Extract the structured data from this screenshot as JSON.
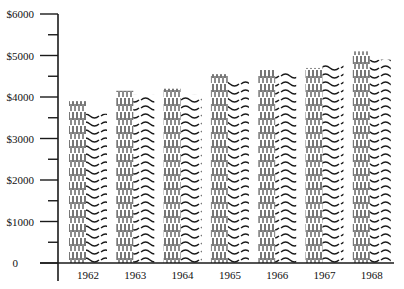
{
  "chart_data": {
    "type": "bar",
    "title": "",
    "xlabel": "",
    "ylabel": "",
    "categories": [
      "1962",
      "1963",
      "1964",
      "1965",
      "1966",
      "1967",
      "1968"
    ],
    "series": [
      {
        "name": "Series A (dashed pattern)",
        "pattern": "dashed-vertical",
        "values": [
          3900,
          4150,
          4200,
          4550,
          4650,
          4700,
          5100
        ]
      },
      {
        "name": "Series B (wavy pattern)",
        "pattern": "wavy-horizontal",
        "values": [
          3600,
          4050,
          4050,
          4400,
          4600,
          4800,
          4900
        ]
      }
    ],
    "ylim": [
      0,
      6000
    ],
    "y_ticks": [
      {
        "value": 0,
        "label": "0"
      },
      {
        "value": 1000,
        "label": "$1000"
      },
      {
        "value": 2000,
        "label": "$2000"
      },
      {
        "value": 3000,
        "label": "$3000"
      },
      {
        "value": 4000,
        "label": "$4000"
      },
      {
        "value": 5000,
        "label": "$5000"
      },
      {
        "value": 6000,
        "label": "$6000"
      }
    ],
    "minor_tick_step": 500,
    "grid": false,
    "legend": "none"
  },
  "colors": {
    "ink": "#1a1a1a",
    "background": "#ffffff"
  }
}
